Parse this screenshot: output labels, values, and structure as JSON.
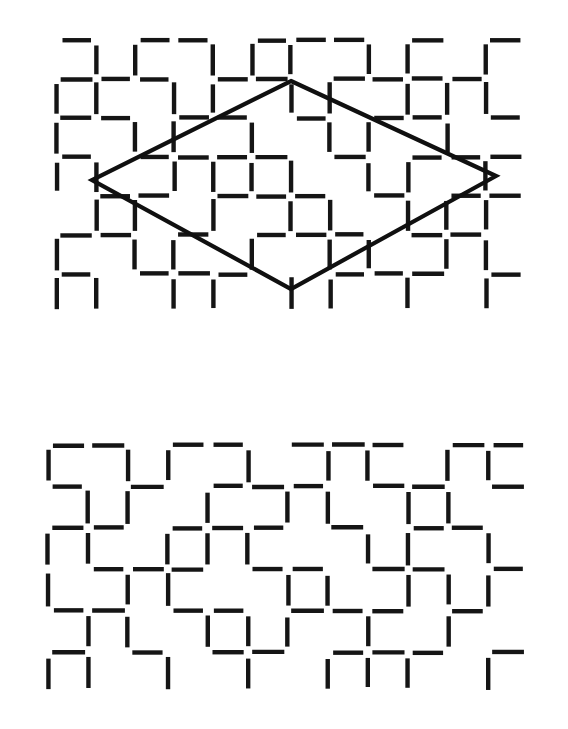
{
  "figure": {
    "background_color": "#ffffff",
    "ink_color": "#151515",
    "panel_count": 2
  },
  "panels": [
    {
      "id": "panel-top",
      "label": "upper-texture-panel-with-outline",
      "has_outline": true,
      "origin": {
        "x": 57,
        "y": 40
      },
      "pitch": {
        "x": 39,
        "y": 39
      },
      "cols": 12,
      "rows": 7,
      "segment_length": 30,
      "stroke_width": 4.4
    },
    {
      "id": "panel-bottom",
      "label": "lower-texture-panel-plain",
      "has_outline": false,
      "origin": {
        "x": 48,
        "y": 55
      },
      "pitch": {
        "x": 40,
        "y": 41.5
      },
      "cols": 12,
      "rows": 6,
      "segment_length": 31,
      "stroke_width": 4.4
    }
  ],
  "outline": {
    "name": "rhombus-outline",
    "shape": "rhombus",
    "stroke_width": 4.2,
    "color": "#101010",
    "vertices": [
      {
        "name": "top",
        "x": 291,
        "y": 81
      },
      {
        "name": "right",
        "x": 496,
        "y": 176
      },
      {
        "name": "bottom",
        "x": 291,
        "y": 289
      },
      {
        "name": "left",
        "x": 92,
        "y": 180
      }
    ]
  },
  "texture_top": {
    "horizontal_rows": [
      "101101110101",
      "111011011110",
      "110110101101",
      "101111010111",
      "011011101011",
      "110101110110",
      "101110011101"
    ],
    "vertical_rows": [
      "011011101101",
      "110110110111",
      "101101011010",
      "110111101101",
      "011010110111",
      "101101011011",
      "110110110101"
    ]
  },
  "texture_bottom": {
    "horizontal_rows": [
      "110110111011",
      "101011101101",
      "110111010110",
      "011101101101",
      "110110111010",
      "101011011101"
    ],
    "vertical_rows": [
      "101101011011",
      "011010110110",
      "110111001101",
      "101100110111",
      "011011101010",
      "110101011101"
    ]
  }
}
